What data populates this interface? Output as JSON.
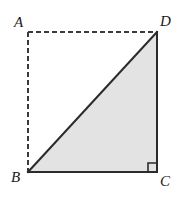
{
  "figure": {
    "type": "geometry-diagram",
    "background_color": "#ffffff",
    "stroke_color": "#2b2b2b",
    "dashed_stroke_color": "#3a3a3a",
    "triangle_fill_color": "#e3e3e3",
    "stroke_width": 2,
    "dashed_stroke_width": 2,
    "dash_pattern": "5 3",
    "vertices": [
      {
        "name": "A",
        "label": "A",
        "x": 28,
        "y": 32,
        "label_x": 14,
        "label_y": 15
      },
      {
        "name": "D",
        "label": "D",
        "x": 157,
        "y": 32,
        "label_x": 160,
        "label_y": 14
      },
      {
        "name": "B",
        "label": "B",
        "x": 28,
        "y": 172,
        "label_x": 11,
        "label_y": 170
      },
      {
        "name": "C",
        "label": "C",
        "x": 157,
        "y": 172,
        "label_x": 160,
        "label_y": 174
      }
    ],
    "segments": [
      {
        "name": "AD",
        "from": "A",
        "to": "D",
        "style": "dashed"
      },
      {
        "name": "AB",
        "from": "A",
        "to": "B",
        "style": "dashed"
      },
      {
        "name": "BD",
        "from": "B",
        "to": "D",
        "style": "solid"
      },
      {
        "name": "DC",
        "from": "D",
        "to": "C",
        "style": "solid"
      },
      {
        "name": "BC",
        "from": "B",
        "to": "C",
        "style": "solid"
      }
    ],
    "shaded_region": {
      "name": "triangle-BDC",
      "points": "28,172 157,32 157,172"
    },
    "right_angle_marker": {
      "at_vertex": "C",
      "size": 9,
      "points": "148,172 148,163 157,163"
    }
  }
}
